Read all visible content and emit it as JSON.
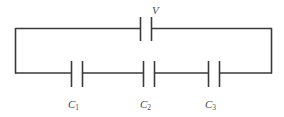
{
  "figure": {
    "name": "series-capacitor-circuit",
    "background_color": "#ffffff",
    "line_color": "#3a3a3a",
    "text_color": "#4a4a4a"
  },
  "source": {
    "label": "V",
    "label_letter": "V",
    "type": "voltage-source",
    "position": "top-branch-center"
  },
  "capacitors": [
    {
      "label": "C",
      "subscript": "1",
      "full_label": "C1",
      "position": "bottom-branch-left"
    },
    {
      "label": "C",
      "subscript": "2",
      "full_label": "C2",
      "position": "bottom-branch-center"
    },
    {
      "label": "C",
      "subscript": "3",
      "full_label": "C3",
      "position": "bottom-branch-right"
    }
  ],
  "geometry": {
    "loop_left_x": 15,
    "loop_right_x": 272,
    "top_wire_y": 28,
    "bottom_wire_y": 73
  }
}
